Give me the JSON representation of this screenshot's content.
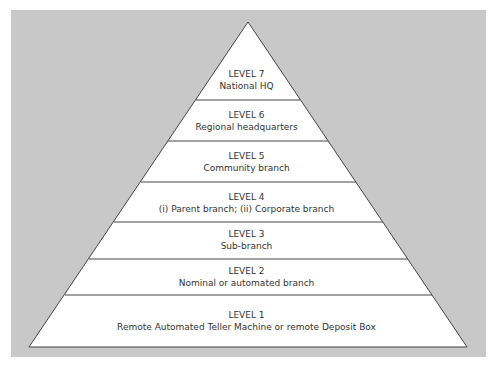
{
  "diagram": {
    "type": "pyramid",
    "colors": {
      "background": "#c8c8c8",
      "fill": "#ffffff",
      "stroke": "#444444"
    },
    "levels": [
      {
        "level": "LEVEL 7",
        "name": "National HQ"
      },
      {
        "level": "LEVEL 6",
        "name": "Regional headquarters"
      },
      {
        "level": "LEVEL 5",
        "name": "Community branch"
      },
      {
        "level": "LEVEL 4",
        "name": "(i) Parent branch; (ii) Corporate branch"
      },
      {
        "level": "LEVEL 3",
        "name": "Sub-branch"
      },
      {
        "level": "LEVEL 2",
        "name": "Nominal or automated branch"
      },
      {
        "level": "LEVEL 1",
        "name": "Remote Automated Teller Machine or remote Deposit Box"
      }
    ]
  }
}
